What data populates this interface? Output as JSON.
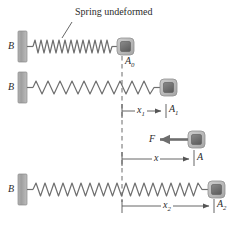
{
  "figure": {
    "name": "spring-deformation-diagram",
    "background_color": "#ffffff",
    "ink_color": "#555555",
    "text_color": "#2b2b2b"
  },
  "annotations": {
    "caption": "Spring undeformed",
    "wall_label": "B",
    "block_label_0": "A",
    "block_label_0_sub": "0",
    "block_label_1": "A",
    "block_label_1_sub": "1",
    "block_label_force": "A",
    "block_label_2": "A",
    "block_label_2_sub": "2",
    "force_label": "F",
    "dim_label_x1": "x",
    "dim_label_x1_sub": "1",
    "dim_label_x": "x",
    "dim_label_x2": "x",
    "dim_label_x2_sub": "2"
  },
  "rows": [
    {
      "id": "row-undeformed",
      "wall_label": "B",
      "spring_state": "undeformed",
      "coil_count": 20,
      "block_position_label": "A0"
    },
    {
      "id": "row-stretched-1",
      "wall_label": "B",
      "spring_state": "stretched",
      "coil_count": 15,
      "block_position_label": "A1",
      "dimension": "x1"
    },
    {
      "id": "row-force",
      "block_position_label": "A",
      "force_label": "F",
      "force_direction": "left",
      "dimension": "x"
    },
    {
      "id": "row-stretched-2",
      "wall_label": "B",
      "spring_state": "stretched-max",
      "coil_count": 22,
      "block_position_label": "A2",
      "dimension": "x2"
    }
  ],
  "colors": {
    "spring": "#6f6f6f",
    "wall_fill": "#9a9a9a",
    "block_outer": "#b9b9b9",
    "block_inner": "#6b6b6b",
    "dashed_line": "#6a6a6a",
    "dimension_line": "#555555",
    "force_arrow": "#6a6a6a"
  },
  "geometry": {
    "reference_line_x": 122,
    "width": 239,
    "height": 225
  }
}
